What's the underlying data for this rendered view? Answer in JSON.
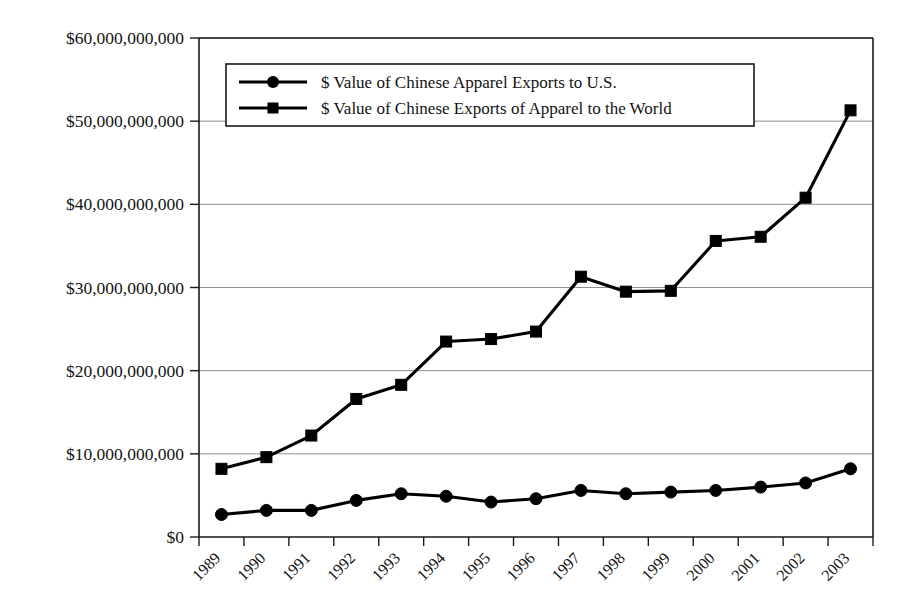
{
  "chart_data": {
    "type": "line",
    "title": "",
    "subtitle": "",
    "xlabel": "",
    "ylabel": "",
    "categories": [
      "1989",
      "1990",
      "1991",
      "1992",
      "1993",
      "1994",
      "1995",
      "1996",
      "1997",
      "1998",
      "1999",
      "2000",
      "2001",
      "2002",
      "2003"
    ],
    "series": [
      {
        "name": "$ Value of Chinese Apparel Exports to U.S.",
        "marker": "circle",
        "color": "#000000",
        "values": [
          2700000000,
          3200000000,
          3200000000,
          4400000000,
          5200000000,
          4900000000,
          4200000000,
          4600000000,
          5600000000,
          5200000000,
          5400000000,
          5600000000,
          6000000000,
          6500000000,
          8200000000
        ]
      },
      {
        "name": "$ Value of Chinese Exports of Apparel to the World",
        "marker": "square",
        "color": "#000000",
        "values": [
          8200000000,
          9600000000,
          12200000000,
          16600000000,
          18300000000,
          23500000000,
          23800000000,
          24700000000,
          31300000000,
          29500000000,
          29600000000,
          35600000000,
          36100000000,
          40800000000,
          51300000000
        ]
      }
    ],
    "ylim": [
      0,
      60000000000
    ],
    "ytick_values": [
      0,
      10000000000,
      20000000000,
      30000000000,
      40000000000,
      50000000000,
      60000000000
    ],
    "ytick_labels": [
      "$0",
      "$10,000,000,000",
      "$20,000,000,000",
      "$30,000,000,000",
      "$40,000,000,000",
      "$50,000,000,000",
      "$60,000,000,000"
    ],
    "grid": true,
    "legend_position": "top-center"
  },
  "legend": {
    "entries": [
      {
        "label": "$ Value of Chinese Apparel Exports to U.S.",
        "marker": "circle"
      },
      {
        "label": "$ Value of Chinese Exports of Apparel to the World",
        "marker": "square"
      }
    ]
  }
}
